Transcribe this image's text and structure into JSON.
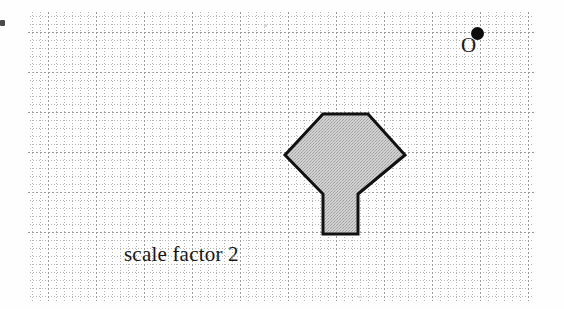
{
  "figure": {
    "caption": "scale factor 2",
    "centre_label": "O",
    "centre_point": {
      "x": 477,
      "y": 33
    },
    "background": "#fefefe",
    "shape": {
      "name": "arrow-kite-polygon",
      "fill": "#c8c8c8",
      "stroke": "#111111",
      "stroke_width": 3,
      "vertices": [
        {
          "x": 323,
          "y": 114
        },
        {
          "x": 368,
          "y": 114
        },
        {
          "x": 405,
          "y": 155
        },
        {
          "x": 358,
          "y": 194
        },
        {
          "x": 358,
          "y": 234
        },
        {
          "x": 323,
          "y": 234
        },
        {
          "x": 323,
          "y": 194
        },
        {
          "x": 285,
          "y": 155
        }
      ]
    },
    "grid": {
      "minor_spacing": 8,
      "major_spacing_x": 48,
      "major_spacing_y": 40,
      "major_x": [
        48,
        96,
        144,
        192,
        240,
        288,
        336,
        384,
        432,
        480,
        528
      ],
      "major_y": [
        32,
        72,
        112,
        152,
        192,
        232,
        271
      ],
      "minor_color": "#b6b6b6",
      "major_color": "#9a9a9a"
    }
  }
}
